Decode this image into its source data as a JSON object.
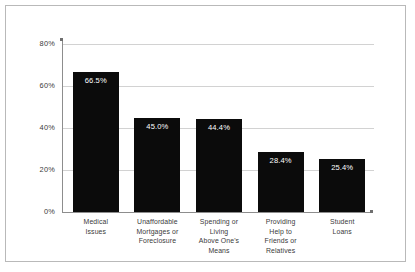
{
  "chart_data": {
    "type": "bar",
    "title": "",
    "subtitle": "",
    "xlabel": "",
    "ylabel": "",
    "categories": [
      "Medical Issues",
      "Unaffordable Mortgages or Foreclosure",
      "Spending or Living Above One's Means",
      "Providing Help to Friends or Relatives",
      "Student Loans"
    ],
    "category_lines": [
      [
        "Medical",
        "Issues"
      ],
      [
        "Unaffordable",
        "Mortgages or",
        "Foreclosure"
      ],
      [
        "Spending or",
        "Living",
        "Above One's",
        "Means"
      ],
      [
        "Providing",
        "Help to",
        "Friends or",
        "Relatives"
      ],
      [
        "Student",
        "Loans"
      ]
    ],
    "values": [
      66.5,
      45.0,
      44.4,
      28.4,
      25.4
    ],
    "value_labels": [
      "66.5%",
      "45.0%",
      "44.4%",
      "28.4%",
      "25.4%"
    ],
    "ylim": [
      0,
      80
    ],
    "yticks": [
      0,
      20,
      40,
      60,
      80
    ],
    "ytick_labels": [
      "0%",
      "20%",
      "40%",
      "60%",
      "80%"
    ],
    "grid": true,
    "grid_axis": "y",
    "legend": false,
    "legend_position": "none",
    "bar_color": "#0b0b0b",
    "value_label_color": "#ffffff",
    "grid_color": "#d2d2d2",
    "axis_color": "#8d8d8d",
    "text_color": "#3a3a3a",
    "background_color": "#ffffff",
    "frame_color": "#b9b9b9"
  }
}
